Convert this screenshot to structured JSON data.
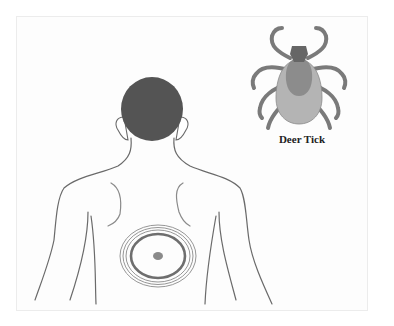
{
  "figure": {
    "tick_label": "Deer Tick",
    "colors": {
      "hair": "#545454",
      "outline": "#6a6a6a",
      "rash_ring": "#6e6e6e",
      "rash_center": "#8a8a8a",
      "tick_legs": "#7a7a7a",
      "tick_head": "#666666",
      "tick_shield": "#8c8c8c",
      "tick_body": "#b4b4b4",
      "frame_border": "#ececec"
    }
  }
}
